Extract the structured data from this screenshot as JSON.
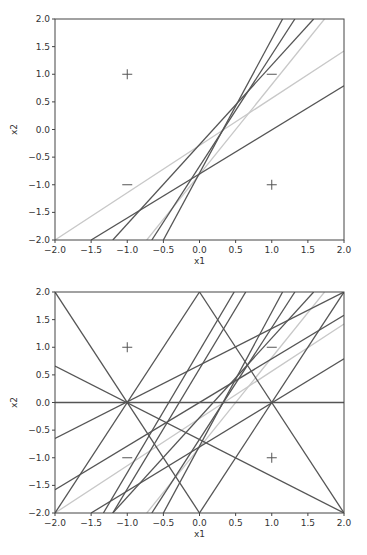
{
  "chart_data": [
    {
      "type": "line",
      "title": "",
      "xlabel": "x1",
      "ylabel": "x2",
      "xlim": [
        -2.0,
        2.0
      ],
      "ylim": [
        -2.0,
        2.0
      ],
      "grid": false,
      "xticks": [
        "-2.0",
        "-1.5",
        "-1.0",
        "-0.5",
        "0.0",
        "0.5",
        "1.0",
        "1.5",
        "2.0"
      ],
      "yticks": [
        "-2.0",
        "-1.5",
        "-1.0",
        "-0.5",
        "0.0",
        "0.5",
        "1.0",
        "1.5",
        "2.0"
      ],
      "markers": [
        {
          "x": -1,
          "y": 1,
          "label": "+"
        },
        {
          "x": 1,
          "y": 1,
          "label": "−"
        },
        {
          "x": -1,
          "y": -1,
          "label": "−"
        },
        {
          "x": 1,
          "y": -1,
          "label": "+"
        }
      ],
      "series": [
        {
          "name": "line-light-a",
          "color": "#c8c8c8",
          "points": [
            [
              -2.0,
              -2.0
            ],
            [
              2.0,
              1.42
            ]
          ]
        },
        {
          "name": "line-light-b",
          "color": "#c8c8c8",
          "points": [
            [
              -0.73,
              -2.0
            ],
            [
              1.73,
              2.0
            ]
          ]
        },
        {
          "name": "line-c",
          "color": "#555555",
          "points": [
            [
              -1.5,
              -2.0
            ],
            [
              2.0,
              0.79
            ]
          ]
        },
        {
          "name": "line-d",
          "color": "#555555",
          "points": [
            [
              -1.2,
              -2.0
            ],
            [
              1.58,
              2.0
            ]
          ]
        },
        {
          "name": "line-e",
          "color": "#555555",
          "points": [
            [
              -0.66,
              -2.0
            ],
            [
              1.32,
              2.0
            ]
          ]
        },
        {
          "name": "line-f",
          "color": "#555555",
          "points": [
            [
              -0.5,
              -2.0
            ],
            [
              1.15,
              2.0
            ]
          ]
        }
      ]
    },
    {
      "type": "line",
      "title": "",
      "xlabel": "x1",
      "ylabel": "x2",
      "xlim": [
        -2.0,
        2.0
      ],
      "ylim": [
        -2.0,
        2.0
      ],
      "grid": false,
      "xticks": [
        "-2.0",
        "-1.5",
        "-1.0",
        "-0.5",
        "0.0",
        "0.5",
        "1.0",
        "1.5",
        "2.0"
      ],
      "yticks": [
        "-2.0",
        "-1.5",
        "-1.0",
        "-0.5",
        "0.0",
        "0.5",
        "1.0",
        "1.5",
        "2.0"
      ],
      "markers": [
        {
          "x": -1,
          "y": 1,
          "label": "+"
        },
        {
          "x": 1,
          "y": 1,
          "label": "−"
        },
        {
          "x": -1,
          "y": -1,
          "label": "−"
        },
        {
          "x": 1,
          "y": -1,
          "label": "+"
        }
      ],
      "series": [
        {
          "name": "line-light-a",
          "color": "#c8c8c8",
          "points": [
            [
              -2.0,
              -2.0
            ],
            [
              2.0,
              1.42
            ]
          ]
        },
        {
          "name": "line-light-b",
          "color": "#c8c8c8",
          "points": [
            [
              -0.73,
              -2.0
            ],
            [
              1.73,
              2.0
            ]
          ]
        },
        {
          "name": "line-c",
          "color": "#555555",
          "points": [
            [
              -1.5,
              -2.0
            ],
            [
              2.0,
              0.79
            ]
          ]
        },
        {
          "name": "line-d",
          "color": "#555555",
          "points": [
            [
              -1.2,
              -2.0
            ],
            [
              1.58,
              2.0
            ]
          ]
        },
        {
          "name": "line-e",
          "color": "#555555",
          "points": [
            [
              -0.66,
              -2.0
            ],
            [
              1.32,
              2.0
            ]
          ]
        },
        {
          "name": "line-f",
          "color": "#555555",
          "points": [
            [
              -0.5,
              -2.0
            ],
            [
              1.15,
              2.0
            ]
          ]
        },
        {
          "name": "line-horizontal",
          "color": "#555555",
          "points": [
            [
              -2.0,
              0.0
            ],
            [
              2.0,
              0.0
            ]
          ]
        },
        {
          "name": "line-g",
          "color": "#555555",
          "points": [
            [
              -2.0,
              2.0
            ],
            [
              0.0,
              -2.0
            ]
          ]
        },
        {
          "name": "line-h",
          "color": "#555555",
          "points": [
            [
              -2.0,
              -2.0
            ],
            [
              0.0,
              2.0
            ]
          ]
        },
        {
          "name": "line-i",
          "color": "#555555",
          "points": [
            [
              0.0,
              2.0
            ],
            [
              2.0,
              -2.0
            ]
          ]
        },
        {
          "name": "line-j",
          "color": "#555555",
          "points": [
            [
              0.0,
              -2.0
            ],
            [
              2.0,
              2.0
            ]
          ]
        },
        {
          "name": "line-k",
          "color": "#555555",
          "points": [
            [
              -2.0,
              0.66
            ],
            [
              2.0,
              -2.0
            ]
          ]
        },
        {
          "name": "line-l",
          "color": "#555555",
          "points": [
            [
              -2.0,
              -0.65
            ],
            [
              2.0,
              2.0
            ]
          ]
        },
        {
          "name": "line-m",
          "color": "#555555",
          "points": [
            [
              -2.0,
              -1.58
            ],
            [
              2.0,
              1.58
            ]
          ]
        },
        {
          "name": "line-n",
          "color": "#555555",
          "points": [
            [
              -1.33,
              -2.0
            ],
            [
              0.48,
              2.0
            ]
          ]
        },
        {
          "name": "line-o",
          "color": "#555555",
          "points": [
            [
              -1.2,
              -2.0
            ],
            [
              0.64,
              2.0
            ]
          ]
        }
      ]
    }
  ]
}
